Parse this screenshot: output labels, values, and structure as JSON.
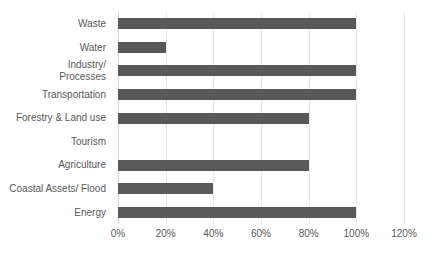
{
  "chart_data": {
    "type": "bar",
    "orientation": "horizontal",
    "title": "",
    "subtitle": "",
    "xlabel": "",
    "ylabel": "",
    "grid": true,
    "legend": false,
    "bar_color": "#595959",
    "gridline_color": "#e8e8e8",
    "xlim": [
      0,
      120
    ],
    "xticks": [
      "0%",
      "20%",
      "40%",
      "60%",
      "80%",
      "100%",
      "120%"
    ],
    "xtick_values": [
      0,
      20,
      40,
      60,
      80,
      100,
      120
    ],
    "categories": [
      "Waste",
      "Water",
      "Industry/\nProcesses",
      "Transportation",
      "Forestry & Land use",
      "Tourism",
      "Agriculture",
      "Coastal Assets/ Flood",
      "Energy"
    ],
    "values": [
      100,
      20,
      100,
      100,
      80,
      0,
      80,
      40,
      100
    ],
    "value_labels": [
      "100%",
      "20%",
      "100%",
      "100%",
      "80%",
      "0%",
      "80%",
      "40%",
      "100%"
    ]
  }
}
